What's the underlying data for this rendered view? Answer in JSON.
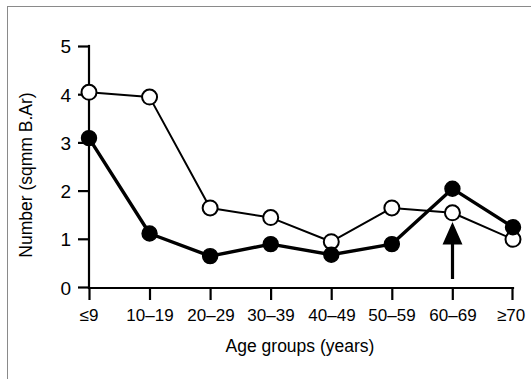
{
  "chart_data": {
    "type": "line",
    "title": "",
    "xlabel": "Age groups (years)",
    "ylabel": "Number (sqmm B.Ar)",
    "categories": [
      "≤9",
      "10–19",
      "20–29",
      "30–39",
      "40–49",
      "50–59",
      "60–69",
      "≥70"
    ],
    "ylim": [
      0,
      5
    ],
    "ytick_labels": [
      "0",
      "1",
      "2",
      "3",
      "4",
      "5"
    ],
    "ytick_values": [
      0,
      1,
      2,
      3,
      4,
      5
    ],
    "grid": false,
    "legend": "none",
    "series": [
      {
        "name": "open-circle-series",
        "marker": "open circle",
        "values": [
          4.05,
          3.95,
          1.65,
          1.45,
          0.95,
          1.65,
          1.55,
          1.0
        ]
      },
      {
        "name": "filled-circle-series",
        "marker": "filled circle",
        "values": [
          3.1,
          1.12,
          0.65,
          0.9,
          0.68,
          0.9,
          2.05,
          1.25
        ]
      }
    ],
    "annotations": [
      {
        "type": "arrow",
        "direction": "up",
        "at_category": "60–69",
        "label": ""
      }
    ]
  }
}
